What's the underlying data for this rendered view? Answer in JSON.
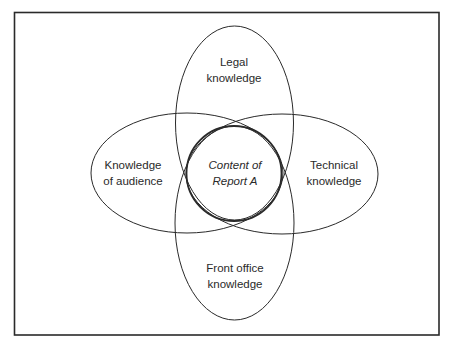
{
  "diagram": {
    "type": "venn",
    "center": {
      "line1": "Content of",
      "line2": "Report A"
    },
    "sets": [
      {
        "id": "legal",
        "position": "top",
        "line1": "Legal",
        "line2": "knowledge"
      },
      {
        "id": "audience",
        "position": "left",
        "line1": "Knowledge",
        "line2": "of audience"
      },
      {
        "id": "technical",
        "position": "right",
        "line1": "Technical",
        "line2": "knowledge"
      },
      {
        "id": "front-office",
        "position": "bottom",
        "line1": "Front office",
        "line2": "knowledge"
      }
    ]
  },
  "colors": {
    "stroke": "#2a2a2a",
    "background": "#ffffff",
    "text": "#2a2a2a"
  }
}
